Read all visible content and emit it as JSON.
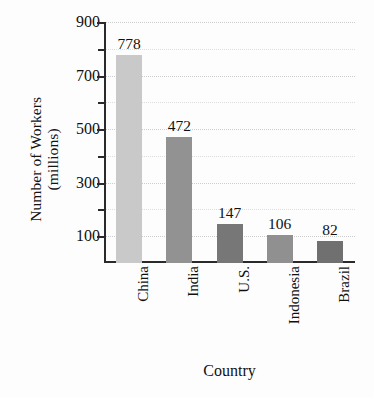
{
  "chart_data": {
    "type": "bar",
    "title": "",
    "xlabel": "Country",
    "ylabel": "Number of Workers (millions)",
    "ylabel_line1": "Number of Workers",
    "ylabel_line2": "(millions)",
    "categories": [
      "China",
      "India",
      "U.S.",
      "Indonesia",
      "Brazil"
    ],
    "values": [
      778,
      472,
      147,
      106,
      82
    ],
    "value_labels": [
      "778",
      "472",
      "147",
      "106",
      "82"
    ],
    "ylim": [
      0,
      900
    ],
    "ytick_labels": [
      "900",
      "700",
      "500",
      "300",
      "100"
    ],
    "ytick_values": [
      900,
      700,
      500,
      300,
      100
    ],
    "yminor_tick_values": [
      800,
      600,
      400,
      200
    ],
    "grid": true,
    "grid_style": "dotted",
    "legend": "none",
    "bar_colors": [
      "#c9c9c9",
      "#929292",
      "#777777",
      "#909090",
      "#707070"
    ],
    "axis_color": "#2a2a2a",
    "grid_color": "#c5c5c5",
    "background": "#fdfdfd"
  }
}
